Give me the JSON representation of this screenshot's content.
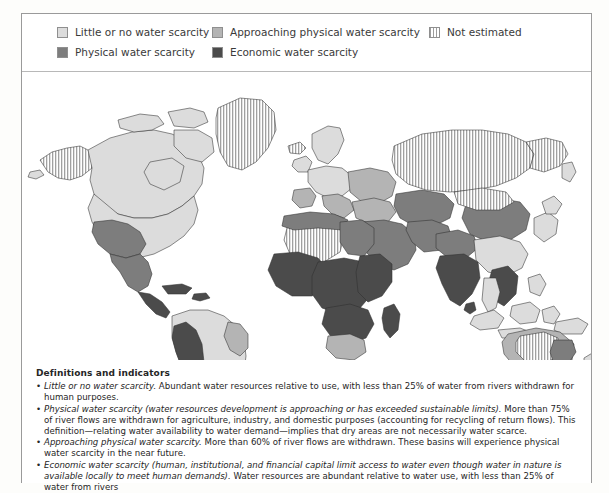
{
  "legend": {
    "items": [
      {
        "id": "little-or-no",
        "label": "Little or no water scarcity",
        "color": "#dcdcdc",
        "pattern": "solid"
      },
      {
        "id": "physical",
        "label": "Physical water scarcity",
        "color": "#7d7d7d",
        "pattern": "solid"
      },
      {
        "id": "approaching-physical",
        "label": "Approaching physical water scarcity",
        "color": "#b4b4b4",
        "pattern": "solid"
      },
      {
        "id": "economic",
        "label": "Economic water scarcity",
        "color": "#4b4b4b",
        "pattern": "solid"
      },
      {
        "id": "not-estimated",
        "label": "Not estimated",
        "color": "#9c9c9c",
        "pattern": "vertical-hatch"
      }
    ]
  },
  "map": {
    "projection_note": "world-map",
    "regions": [
      {
        "name": "Alaska",
        "category": "not-estimated"
      },
      {
        "name": "Greenland",
        "category": "not-estimated"
      },
      {
        "name": "Canada",
        "category": "little-or-no"
      },
      {
        "name": "United States (east)",
        "category": "little-or-no"
      },
      {
        "name": "United States (southwest)",
        "category": "physical"
      },
      {
        "name": "Mexico (north)",
        "category": "physical"
      },
      {
        "name": "Central America",
        "category": "economic"
      },
      {
        "name": "Caribbean",
        "category": "economic"
      },
      {
        "name": "South America (Amazon)",
        "category": "little-or-no"
      },
      {
        "name": "Andes / Peru / Bolivia",
        "category": "economic"
      },
      {
        "name": "Brazil (northeast)",
        "category": "approaching-physical"
      },
      {
        "name": "Argentina",
        "category": "little-or-no"
      },
      {
        "name": "Western Europe",
        "category": "little-or-no"
      },
      {
        "name": "Spain",
        "category": "approaching-physical"
      },
      {
        "name": "Eastern Europe / Ukraine",
        "category": "approaching-physical"
      },
      {
        "name": "Russia (Siberia)",
        "category": "not-estimated"
      },
      {
        "name": "Turkey / Caucasus",
        "category": "approaching-physical"
      },
      {
        "name": "Middle East / Arabian Peninsula",
        "category": "physical"
      },
      {
        "name": "North Africa (Sahara)",
        "category": "not-estimated"
      },
      {
        "name": "Libya / Egypt",
        "category": "physical"
      },
      {
        "name": "Sub-Saharan Africa",
        "category": "economic"
      },
      {
        "name": "Southern Africa",
        "category": "approaching-physical"
      },
      {
        "name": "Madagascar",
        "category": "economic"
      },
      {
        "name": "Central Asia",
        "category": "physical"
      },
      {
        "name": "India",
        "category": "economic"
      },
      {
        "name": "Pakistan / Northern India",
        "category": "physical"
      },
      {
        "name": "China (north)",
        "category": "physical"
      },
      {
        "name": "China (south)",
        "category": "little-or-no"
      },
      {
        "name": "Mongolia",
        "category": "not-estimated"
      },
      {
        "name": "Southeast Asia",
        "category": "economic"
      },
      {
        "name": "Indonesia",
        "category": "little-or-no"
      },
      {
        "name": "Japan / Korea",
        "category": "little-or-no"
      },
      {
        "name": "Australia (interior)",
        "category": "not-estimated"
      },
      {
        "name": "Australia (southeast)",
        "category": "physical"
      },
      {
        "name": "New Zealand",
        "category": "little-or-no"
      }
    ]
  },
  "definitions": {
    "heading": "Definitions and indicators",
    "bullets": [
      {
        "term": "Little or no water scarcity.",
        "text": " Abundant water resources relative to use, with less than 25% of water from rivers withdrawn for human purposes."
      },
      {
        "term": "Physical water scarcity (water resources development is approaching or has exceeded sustainable limits).",
        "text": " More than 75% of river flows are withdrawn for agriculture, industry, and domestic purposes (accounting for recycling of return flows). This definition—relating water availability to water demand—implies that dry areas are not necessarily water scarce."
      },
      {
        "term": "Approaching physical water scarcity.",
        "text": " More than 60% of river flows are withdrawn. These basins will experience physical water scarcity in the near future."
      },
      {
        "term": "Economic water scarcity (human, institutional, and financial capital limit access to water even though water in nature is available locally to meet human demands).",
        "text": " Water resources are abundant relative to water use, with less than 25% of water from rivers"
      }
    ]
  }
}
